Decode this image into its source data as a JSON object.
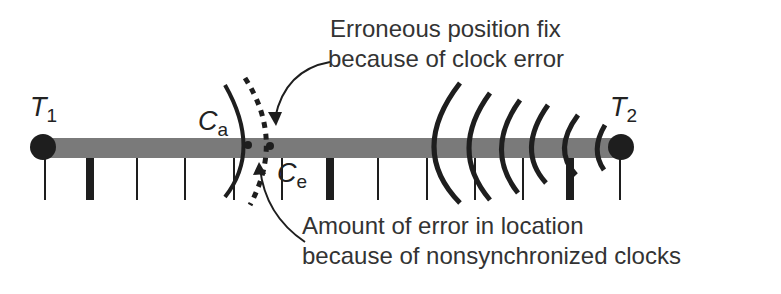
{
  "diagram": {
    "title_annotation_top": {
      "line1": "Erroneous position fix",
      "line2": "because of clock error"
    },
    "annotation_bottom": {
      "line1": "Amount of error in location",
      "line2": "because of nonsynchronized clocks"
    },
    "transmitters": [
      {
        "symbol": "T",
        "subscript": "1"
      },
      {
        "symbol": "T",
        "subscript": "2"
      }
    ],
    "points": [
      {
        "symbol": "C",
        "subscript": "a",
        "meaning": "actual position"
      },
      {
        "symbol": "C",
        "subscript": "e",
        "meaning": "erroneous position"
      }
    ],
    "colors": {
      "bar": "#7a7a7a",
      "ink": "#1e1e1e",
      "text": "#333333"
    }
  }
}
